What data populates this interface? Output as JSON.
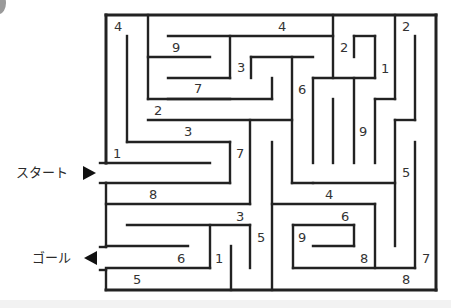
{
  "puzzle": {
    "type": "maze",
    "start_label": "スタート",
    "goal_label": "ゴール",
    "start_arrow": "right-triangle",
    "goal_arrow": "left-triangle",
    "line_color": "#222222"
  },
  "numbers": [
    {
      "v": "4",
      "x": 114,
      "y": 20
    },
    {
      "v": "4",
      "x": 278,
      "y": 20
    },
    {
      "v": "9",
      "x": 172,
      "y": 41
    },
    {
      "v": "2",
      "x": 340,
      "y": 41
    },
    {
      "v": "2",
      "x": 402,
      "y": 20
    },
    {
      "v": "3",
      "x": 237,
      "y": 61
    },
    {
      "v": "1",
      "x": 381,
      "y": 62
    },
    {
      "v": "7",
      "x": 194,
      "y": 82
    },
    {
      "v": "6",
      "x": 298,
      "y": 83
    },
    {
      "v": "2",
      "x": 154,
      "y": 104
    },
    {
      "v": "3",
      "x": 184,
      "y": 125
    },
    {
      "v": "9",
      "x": 359,
      "y": 125
    },
    {
      "v": "1",
      "x": 113,
      "y": 147
    },
    {
      "v": "7",
      "x": 236,
      "y": 147
    },
    {
      "v": "5",
      "x": 402,
      "y": 166
    },
    {
      "v": "8",
      "x": 149,
      "y": 188
    },
    {
      "v": "4",
      "x": 325,
      "y": 188
    },
    {
      "v": "3",
      "x": 236,
      "y": 210
    },
    {
      "v": "6",
      "x": 341,
      "y": 210
    },
    {
      "v": "5",
      "x": 257,
      "y": 231
    },
    {
      "v": "9",
      "x": 298,
      "y": 231
    },
    {
      "v": "6",
      "x": 177,
      "y": 252
    },
    {
      "v": "1",
      "x": 215,
      "y": 252
    },
    {
      "v": "8",
      "x": 360,
      "y": 252
    },
    {
      "v": "7",
      "x": 422,
      "y": 252
    },
    {
      "v": "5",
      "x": 133,
      "y": 273
    },
    {
      "v": "8",
      "x": 402,
      "y": 273
    }
  ],
  "walls": [
    [
      106,
      15,
      436,
      15
    ],
    [
      436,
      15,
      436,
      290
    ],
    [
      106,
      290,
      436,
      290
    ],
    [
      106,
      15,
      106,
      163
    ],
    [
      100,
      163,
      106,
      163
    ],
    [
      106,
      183,
      106,
      247
    ],
    [
      100,
      183,
      106,
      183
    ],
    [
      100,
      247,
      106,
      247
    ],
    [
      106,
      270,
      106,
      290
    ],
    [
      100,
      270,
      106,
      270
    ],
    [
      148,
      15,
      148,
      99
    ],
    [
      168,
      36,
      333,
      36
    ],
    [
      148,
      57,
      210,
      57
    ],
    [
      168,
      78,
      230,
      78
    ],
    [
      148,
      99,
      230,
      99
    ],
    [
      230,
      36,
      230,
      78
    ],
    [
      251,
      57,
      313,
      57
    ],
    [
      251,
      57,
      251,
      78
    ],
    [
      272,
      78,
      272,
      99
    ],
    [
      168,
      99,
      272,
      99
    ],
    [
      127,
      36,
      127,
      142
    ],
    [
      148,
      120,
      292,
      120
    ],
    [
      127,
      142,
      230,
      142
    ],
    [
      230,
      142,
      230,
      183
    ],
    [
      106,
      163,
      210,
      163
    ],
    [
      106,
      183,
      230,
      183
    ],
    [
      292,
      57,
      292,
      183
    ],
    [
      250,
      120,
      250,
      204
    ],
    [
      106,
      204,
      250,
      204
    ],
    [
      313,
      78,
      313,
      163
    ],
    [
      313,
      78,
      375,
      78
    ],
    [
      333,
      15,
      333,
      78
    ],
    [
      354,
      36,
      375,
      36
    ],
    [
      375,
      36,
      375,
      78
    ],
    [
      354,
      36,
      354,
      57
    ],
    [
      354,
      78,
      354,
      163
    ],
    [
      333,
      99,
      333,
      163
    ],
    [
      395,
      15,
      395,
      99
    ],
    [
      375,
      99,
      395,
      99
    ],
    [
      375,
      99,
      375,
      163
    ],
    [
      415,
      36,
      415,
      120
    ],
    [
      395,
      120,
      415,
      120
    ],
    [
      395,
      120,
      395,
      246
    ],
    [
      292,
      183,
      395,
      183
    ],
    [
      313,
      183,
      313,
      183
    ],
    [
      272,
      142,
      272,
      290
    ],
    [
      127,
      225,
      250,
      225
    ],
    [
      210,
      225,
      210,
      268
    ],
    [
      250,
      225,
      250,
      268
    ],
    [
      231,
      246,
      231,
      290
    ],
    [
      106,
      246,
      188,
      246
    ],
    [
      106,
      268,
      210,
      268
    ],
    [
      272,
      204,
      375,
      204
    ],
    [
      375,
      204,
      375,
      268
    ],
    [
      293,
      225,
      354,
      225
    ],
    [
      293,
      225,
      293,
      268
    ],
    [
      354,
      225,
      354,
      246
    ],
    [
      313,
      246,
      354,
      246
    ],
    [
      293,
      268,
      415,
      268
    ],
    [
      415,
      142,
      415,
      268
    ]
  ]
}
